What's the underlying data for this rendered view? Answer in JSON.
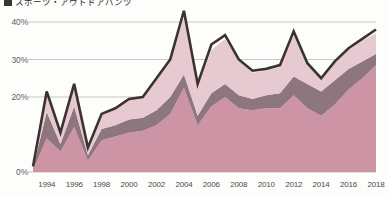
{
  "legend": {
    "marker_color": "#3a3330",
    "label": "スポーツ・アウトドアパンツ"
  },
  "axes": {
    "y_ticks": [
      "40%",
      "30%",
      "20%",
      "0%"
    ],
    "y_tick_values": [
      40,
      30,
      20,
      0
    ],
    "x_ticks": [
      "1994",
      "1996",
      "1998",
      "2000",
      "2002",
      "2004",
      "2006",
      "2008",
      "2010",
      "2012",
      "2014",
      "2016",
      "2018"
    ]
  },
  "colors": {
    "layer_bottom": "#cc94a4",
    "layer_second": "#8d767d",
    "layer_third": "#e7c9d1",
    "outline": "#3a3330",
    "gridline": "#b9b9b9",
    "background": "#fdfdfc"
  },
  "chart_data": {
    "type": "area",
    "title": "",
    "subtitle": "",
    "xlabel": "",
    "ylabel": "",
    "stacked": true,
    "grid": true,
    "legend_position": "top-left",
    "ylim": [
      0,
      45
    ],
    "xlim": [
      1993,
      2018
    ],
    "x": [
      1993,
      1994,
      1995,
      1996,
      1997,
      1998,
      1999,
      2000,
      2001,
      2002,
      2003,
      2004,
      2005,
      2006,
      2007,
      2008,
      2009,
      2010,
      2011,
      2012,
      2013,
      2014,
      2015,
      2016,
      2017,
      2018
    ],
    "series": [
      {
        "name": "layer-1",
        "color": "#cc94a4",
        "values": [
          0.5,
          9.0,
          5.5,
          12.0,
          3.0,
          8.5,
          9.5,
          10.5,
          11.0,
          12.5,
          15.5,
          22.5,
          12.5,
          17.5,
          20.0,
          17.0,
          16.5,
          17.0,
          17.0,
          20.5,
          17.0,
          15.0,
          18.0,
          22.0,
          25.0,
          28.5
        ]
      },
      {
        "name": "layer-2",
        "color": "#8d767d",
        "values": [
          0.5,
          7.0,
          2.0,
          5.5,
          1.5,
          3.0,
          3.0,
          3.5,
          3.5,
          4.0,
          4.5,
          3.5,
          2.5,
          3.5,
          3.5,
          3.5,
          3.0,
          3.5,
          4.0,
          5.0,
          6.5,
          6.5,
          6.5,
          5.5,
          4.5,
          3.0
        ]
      },
      {
        "name": "layer-3",
        "color": "#e7c9d1",
        "values": [
          0.5,
          5.5,
          3.0,
          6.0,
          2.0,
          4.0,
          4.5,
          5.5,
          5.5,
          8.5,
          10.0,
          15.0,
          7.5,
          11.5,
          12.0,
          9.5,
          7.0,
          6.5,
          7.0,
          11.0,
          5.0,
          3.0,
          4.5,
          5.0,
          5.5,
          5.5
        ]
      },
      {
        "name": "total-outline",
        "color": "#3a3330",
        "values": [
          1.5,
          21.5,
          10.5,
          23.5,
          6.5,
          15.5,
          17.0,
          19.5,
          20.0,
          25.0,
          30.0,
          43.0,
          23.5,
          34.0,
          36.5,
          30.0,
          27.0,
          27.5,
          28.5,
          37.5,
          29.0,
          25.0,
          29.5,
          33.0,
          35.5,
          38.0
        ]
      }
    ]
  }
}
